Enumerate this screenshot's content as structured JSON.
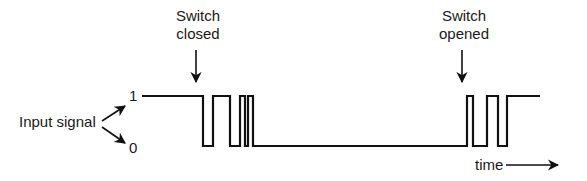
{
  "diagram": {
    "type": "timing-diagram",
    "input_label": "Input signal",
    "level_high_label": "1",
    "level_low_label": "0",
    "annotations": [
      {
        "id": "closed",
        "line1": "Switch",
        "line2": "closed"
      },
      {
        "id": "opened",
        "line1": "Switch",
        "line2": "opened"
      }
    ],
    "time_label": "time",
    "colors": {
      "line": "#111111",
      "background": "#ffffff"
    },
    "waveform": {
      "high_y": 96,
      "low_y": 146,
      "segments_desc": "high until switch closed, bounces 3 times, settles low; at switch opened bounces 2 times, settles high",
      "transitions_x": [
        203,
        213,
        230,
        240,
        245,
        248,
        253,
        467,
        473,
        487,
        498,
        507
      ],
      "start_x": 142,
      "end_x": 540,
      "initial_level": 1
    }
  }
}
